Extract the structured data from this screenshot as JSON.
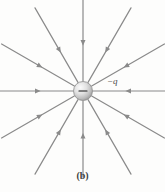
{
  "figure": {
    "caption": "(b)",
    "charge_label": "−q",
    "charge_sign": "−",
    "background_color": "#fdfdfc",
    "line_color": "#8a8a8a",
    "arrow_color": "#8a8a8a",
    "sphere_fill_light": "#f2f2f2",
    "sphere_fill_dark": "#9a9a9a",
    "sphere_edge_color": "#8c8c8c",
    "text_color": "#4a4a4a",
    "charge_center": {
      "x": 83,
      "y": 91
    },
    "charge_radius": 9.5,
    "line_width": 1.2
  },
  "chart_data": {
    "type": "scatter",
    "title": "(b)",
    "subtitle": "",
    "xlabel": "",
    "ylabel": "",
    "annotations": [
      {
        "text": "−q",
        "x": 111,
        "y": 82,
        "describes": "negative point charge"
      },
      {
        "text": "(b)",
        "x": 83,
        "y": 178,
        "describes": "panel caption"
      }
    ],
    "legend": [],
    "grid": false,
    "field_type": "radial-inward",
    "charge_polarity": "negative",
    "charge_magnitude_label": "−q",
    "field_line_count": 12,
    "series": [
      {
        "name": "field-lines",
        "description": "Electric field lines directed radially inward toward the negative point charge",
        "center": {
          "x": 83,
          "y": 91
        },
        "inner_radius": 10,
        "arrow_fraction": 0.42,
        "lines": [
          {
            "angle_deg": 90,
            "length": 84,
            "arrow_at": 0.42
          },
          {
            "angle_deg": 60,
            "length": 86,
            "arrow_at": 0.4
          },
          {
            "angle_deg": 30,
            "length": 84,
            "arrow_at": 0.44
          },
          {
            "angle_deg": 0,
            "length": 81,
            "arrow_at": 0.4
          },
          {
            "angle_deg": -30,
            "length": 84,
            "arrow_at": 0.44
          },
          {
            "angle_deg": -60,
            "length": 86,
            "arrow_at": 0.4
          },
          {
            "angle_deg": -90,
            "length": 76,
            "arrow_at": 0.42
          },
          {
            "angle_deg": -120,
            "length": 86,
            "arrow_at": 0.4
          },
          {
            "angle_deg": -150,
            "length": 84,
            "arrow_at": 0.44
          },
          {
            "angle_deg": 180,
            "length": 81,
            "arrow_at": 0.4
          },
          {
            "angle_deg": 150,
            "length": 84,
            "arrow_at": 0.44
          },
          {
            "angle_deg": 120,
            "length": 86,
            "arrow_at": 0.4
          }
        ]
      }
    ]
  }
}
